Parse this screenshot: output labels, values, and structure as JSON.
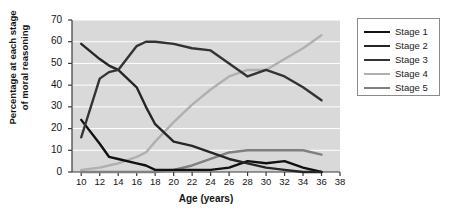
{
  "chart_data": {
    "type": "line",
    "title": "",
    "xlabel": "Age (years)",
    "ylabel": "Percentage at each stage\nof moral reasoning",
    "ylabel_line1": "Percentage at each stage",
    "ylabel_line2": "of moral reasoning",
    "xlim": [
      9,
      38
    ],
    "ylim": [
      0,
      70
    ],
    "ytick_values": [
      0,
      10,
      20,
      30,
      40,
      50,
      60,
      70
    ],
    "xtick_values": [
      10,
      12,
      14,
      16,
      18,
      20,
      22,
      24,
      26,
      28,
      30,
      32,
      34,
      36,
      38
    ],
    "grid": "horizontal-white",
    "plot_background": "#d9d9d9",
    "legend_position": "right-outside",
    "x": [
      10,
      12,
      13,
      14,
      16,
      17,
      18,
      20,
      22,
      24,
      26,
      28,
      30,
      32,
      34,
      36
    ],
    "series": [
      {
        "name": "Stage 1",
        "color": "#111111",
        "values": [
          24,
          13,
          7,
          6,
          4,
          3,
          1,
          1,
          1,
          1,
          2,
          5,
          4,
          5,
          2,
          0
        ]
      },
      {
        "name": "Stage 2",
        "color": "#262626",
        "values": [
          59,
          52,
          49,
          47,
          39,
          30,
          22,
          14,
          12,
          9,
          6,
          4,
          2,
          1,
          0,
          0
        ]
      },
      {
        "name": "Stage 3",
        "color": "#333333",
        "values": [
          16,
          43,
          46,
          47,
          58,
          60,
          60,
          59,
          57,
          56,
          50,
          44,
          47,
          44,
          39,
          33
        ]
      },
      {
        "name": "Stage 4",
        "color": "#b0b0b0",
        "values": [
          1,
          2,
          3,
          4,
          7,
          9,
          14,
          23,
          31,
          38,
          44,
          47,
          47,
          52,
          57,
          63
        ]
      },
      {
        "name": "Stage 5",
        "color": "#808080",
        "values": [
          0,
          0,
          0,
          0,
          0,
          0,
          0,
          1,
          3,
          6,
          9,
          10,
          10,
          10,
          10,
          8
        ]
      }
    ]
  },
  "legend": {
    "entries": [
      {
        "label": "Stage 1",
        "color": "#111111"
      },
      {
        "label": "Stage 2",
        "color": "#262626"
      },
      {
        "label": "Stage 3",
        "color": "#333333"
      },
      {
        "label": "Stage 4",
        "color": "#b0b0b0"
      },
      {
        "label": "Stage 5",
        "color": "#808080"
      }
    ]
  }
}
